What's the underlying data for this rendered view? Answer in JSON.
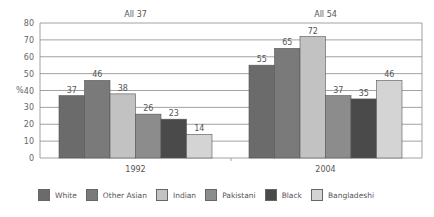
{
  "chart_data": {
    "type": "bar",
    "title": "",
    "xlabel": "",
    "ylabel": "%",
    "ylim": [
      0,
      80
    ],
    "yticks": [
      0,
      10,
      20,
      30,
      40,
      50,
      60,
      70,
      80
    ],
    "grid": true,
    "legend_position": "bottom",
    "categories": [
      "1992",
      "2004"
    ],
    "annotations": [
      "All 37",
      "All 54"
    ],
    "series": [
      {
        "name": "White",
        "values": [
          37,
          55
        ],
        "color": "#6b6b6b"
      },
      {
        "name": "Other Asian",
        "values": [
          46,
          65
        ],
        "color": "#7a7a7a"
      },
      {
        "name": "Indian",
        "values": [
          38,
          72
        ],
        "color": "#c2c2c2"
      },
      {
        "name": "Pakistani",
        "values": [
          26,
          37
        ],
        "color": "#8c8c8c"
      },
      {
        "name": "Black",
        "values": [
          23,
          35
        ],
        "color": "#4a4a4a"
      },
      {
        "name": "Bangladeshi",
        "values": [
          14,
          46
        ],
        "color": "#d4d4d4"
      }
    ]
  }
}
